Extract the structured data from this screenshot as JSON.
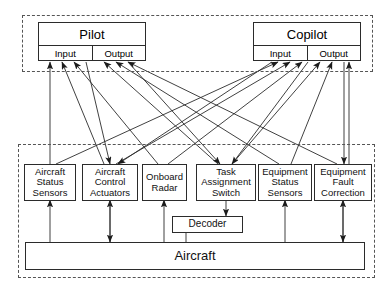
{
  "diagram": {
    "type": "block-diagram",
    "colors": {
      "stroke": "#2b2b2b",
      "dashed_zone": "#555555",
      "background": "#ffffff",
      "text": "#111111"
    },
    "crew_zone": {
      "name": "crew-dashed-zone",
      "members": [
        {
          "id": "pilot",
          "label": "Pilot",
          "ports": [
            {
              "id": "pilot-input",
              "label": "Input"
            },
            {
              "id": "pilot-output",
              "label": "Output"
            }
          ]
        },
        {
          "id": "copilot",
          "label": "Copilot",
          "ports": [
            {
              "id": "copilot-input",
              "label": "Input"
            },
            {
              "id": "copilot-output",
              "label": "Output"
            }
          ]
        }
      ]
    },
    "equipment_zone": {
      "name": "equipment-dashed-zone",
      "components": [
        {
          "id": "aircraft-status-sensors",
          "lines": [
            "Aircraft",
            "Status",
            "Sensors"
          ]
        },
        {
          "id": "aircraft-control-actuators",
          "lines": [
            "Aircraft",
            "Control",
            "Actuators"
          ]
        },
        {
          "id": "onboard-radar",
          "lines": [
            "Onboard",
            "Radar"
          ]
        },
        {
          "id": "task-assignment-switch",
          "lines": [
            "Task",
            "Assignment",
            "Switch"
          ]
        },
        {
          "id": "equipment-status-sensors",
          "lines": [
            "Equipment",
            "Status",
            "Sensors"
          ]
        },
        {
          "id": "equipment-fault-correction",
          "lines": [
            "Equipment",
            "Fault",
            "Correction"
          ]
        }
      ],
      "decoder": {
        "id": "decoder",
        "label": "Decoder"
      },
      "platform": {
        "id": "aircraft",
        "label": "Aircraft"
      }
    }
  }
}
